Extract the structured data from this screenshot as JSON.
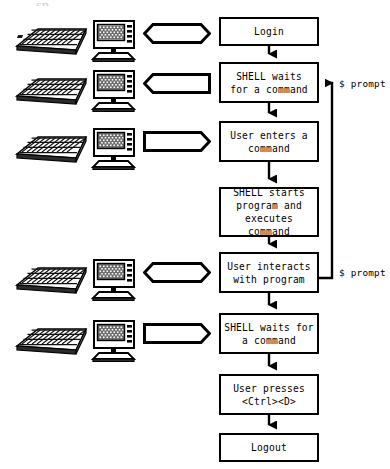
{
  "diagram": {
    "title_fragment": "sp            ",
    "type": "flowchart",
    "orientation": "vertical",
    "stroke_color": "#000000",
    "fill_color": "#ffffff",
    "nodes": [
      {
        "id": "login",
        "label": "Login",
        "shape": "rect",
        "x": 219,
        "y": 17,
        "w": 100,
        "h": 29
      },
      {
        "id": "shellwait1",
        "label": "SHELL waits\nfor a command",
        "shape": "rect",
        "x": 219,
        "y": 62,
        "w": 100,
        "h": 41
      },
      {
        "id": "usercmd",
        "label": "User enters a\ncommand",
        "shape": "rect",
        "x": 219,
        "y": 121,
        "w": 100,
        "h": 41
      },
      {
        "id": "shellstart",
        "label": "SHELL starts\nprogram and\nexecutes command",
        "shape": "rect",
        "x": 219,
        "y": 187,
        "w": 100,
        "h": 50
      },
      {
        "id": "interact",
        "label": "User interacts\nwith program",
        "shape": "rect",
        "x": 219,
        "y": 252,
        "w": 100,
        "h": 41
      },
      {
        "id": "shellwait2",
        "label": "SHELL waits for\na command",
        "shape": "rect",
        "x": 219,
        "y": 313,
        "w": 100,
        "h": 41
      },
      {
        "id": "ctrld",
        "label": "User presses\n<Ctrl><D>",
        "shape": "rect",
        "x": 219,
        "y": 374,
        "w": 100,
        "h": 41
      },
      {
        "id": "logout",
        "label": "Logout",
        "shape": "rect",
        "x": 219,
        "y": 433,
        "w": 100,
        "h": 29
      }
    ],
    "edges": [
      {
        "from": "login",
        "to": "shellwait1",
        "kind": "down-arrow"
      },
      {
        "from": "shellwait1",
        "to": "usercmd",
        "kind": "down-arrow"
      },
      {
        "from": "usercmd",
        "to": "shellstart",
        "kind": "down-arrow"
      },
      {
        "from": "shellstart",
        "to": "interact",
        "kind": "down-arrow"
      },
      {
        "from": "interact",
        "to": "shellwait2",
        "kind": "down-arrow"
      },
      {
        "from": "shellwait2",
        "to": "ctrld",
        "kind": "down-arrow"
      },
      {
        "from": "ctrld",
        "to": "logout",
        "kind": "down-arrow"
      },
      {
        "from": "interact",
        "to": "shellwait1",
        "kind": "feedback-right-up",
        "label": "$ prompt"
      }
    ],
    "annotations": [
      {
        "id": "prompt-top",
        "text": "$ prompt",
        "x": 339,
        "y": 78
      },
      {
        "id": "prompt-bottom",
        "text": "$ prompt",
        "x": 339,
        "y": 267
      }
    ],
    "callouts": [
      {
        "id": "callout-login",
        "shape": "hexagon",
        "direction": "both",
        "x": 143,
        "y": 23,
        "w": 68,
        "h": 21
      },
      {
        "id": "callout-shellwait1",
        "shape": "arrow",
        "direction": "left",
        "x": 143,
        "y": 73,
        "w": 68,
        "h": 21
      },
      {
        "id": "callout-usercmd",
        "shape": "arrow",
        "direction": "right",
        "x": 143,
        "y": 131,
        "w": 68,
        "h": 21
      },
      {
        "id": "callout-interact",
        "shape": "hexagon",
        "direction": "both",
        "x": 143,
        "y": 262,
        "w": 68,
        "h": 21
      },
      {
        "id": "callout-shellwait2",
        "shape": "arrow",
        "direction": "right",
        "x": 143,
        "y": 323,
        "w": 68,
        "h": 21
      }
    ],
    "device_rows": [
      {
        "id": "devices-login",
        "keyboard": "keyboard-icon",
        "monitor": "monitor-icon",
        "x": 14,
        "y": 18
      },
      {
        "id": "devices-shellwait1",
        "keyboard": "keyboard-icon",
        "monitor": "monitor-icon",
        "x": 14,
        "y": 68
      },
      {
        "id": "devices-usercmd",
        "keyboard": "keyboard-icon",
        "monitor": "monitor-icon",
        "x": 14,
        "y": 126
      },
      {
        "id": "devices-interact",
        "keyboard": "keyboard-icon",
        "monitor": "monitor-icon",
        "x": 14,
        "y": 257
      },
      {
        "id": "devices-shellwait2",
        "keyboard": "keyboard-icon",
        "monitor": "monitor-icon",
        "x": 14,
        "y": 318
      }
    ]
  }
}
